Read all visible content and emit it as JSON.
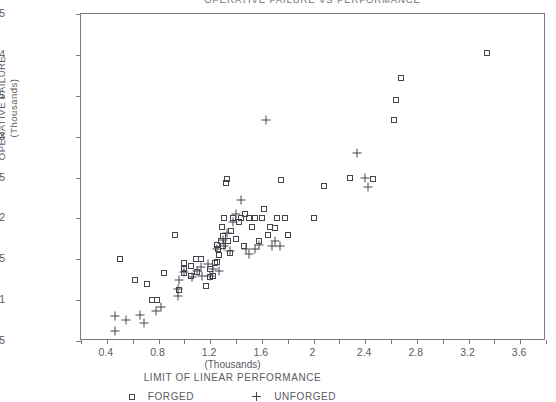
{
  "chart_data": {
    "type": "scatter",
    "title": "OPERATIVE FAILURE VS PERFORMANCE",
    "xlabel": "LIMIT OF LINEAR PERFORMANCE",
    "x_units": "(Thousands)",
    "ylabel": "OPERATIVE FAILURE",
    "y_units": "(Thousands)",
    "xlim": [
      0.2,
      3.8
    ],
    "ylim": [
      0.5,
      4.5
    ],
    "grid": false,
    "legend_position": "bottom",
    "x_ticks": [
      "0.4",
      "0.8",
      "1.2",
      "1.6",
      "2",
      "2.4",
      "2.8",
      "3.2",
      "3.6"
    ],
    "x_tick_values": [
      0.4,
      0.8,
      1.2,
      1.6,
      2.0,
      2.4,
      2.8,
      3.2,
      3.6
    ],
    "y_ticks": [
      "0.5",
      "1",
      "1.5",
      "2",
      "2.5",
      "3",
      "3.5",
      "4",
      "4.5"
    ],
    "y_tick_values": [
      0.5,
      1.0,
      1.5,
      2.0,
      2.5,
      3.0,
      3.5,
      4.0,
      4.5
    ],
    "series": [
      {
        "name": "FORGED",
        "marker": "square",
        "color": "#44444c",
        "points": [
          [
            0.5,
            1.5
          ],
          [
            0.62,
            1.25
          ],
          [
            0.71,
            1.2
          ],
          [
            0.75,
            1.0
          ],
          [
            0.79,
            1.0
          ],
          [
            0.84,
            1.33
          ],
          [
            0.93,
            1.8
          ],
          [
            0.96,
            1.12
          ],
          [
            1.0,
            1.45
          ],
          [
            1.0,
            1.38
          ],
          [
            1.0,
            1.33
          ],
          [
            1.05,
            1.42
          ],
          [
            1.05,
            1.3
          ],
          [
            1.09,
            1.5
          ],
          [
            1.1,
            1.35
          ],
          [
            1.13,
            1.5
          ],
          [
            1.17,
            1.17
          ],
          [
            1.2,
            1.28
          ],
          [
            1.2,
            1.38
          ],
          [
            1.22,
            1.3
          ],
          [
            1.24,
            1.45
          ],
          [
            1.25,
            1.47
          ],
          [
            1.25,
            1.68
          ],
          [
            1.26,
            1.62
          ],
          [
            1.27,
            1.55
          ],
          [
            1.28,
            1.72
          ],
          [
            1.29,
            1.9
          ],
          [
            1.3,
            1.66
          ],
          [
            1.3,
            1.78
          ],
          [
            1.31,
            2.0
          ],
          [
            1.32,
            2.43
          ],
          [
            1.33,
            2.48
          ],
          [
            1.34,
            1.72
          ],
          [
            1.35,
            1.58
          ],
          [
            1.36,
            1.84
          ],
          [
            1.38,
            2.0
          ],
          [
            1.4,
            1.75
          ],
          [
            1.42,
            1.95
          ],
          [
            1.44,
            2.0
          ],
          [
            1.46,
            1.66
          ],
          [
            1.47,
            2.05
          ],
          [
            1.5,
            2.0
          ],
          [
            1.52,
            1.9
          ],
          [
            1.55,
            2.0
          ],
          [
            1.58,
            1.72
          ],
          [
            1.6,
            2.0
          ],
          [
            1.62,
            2.12
          ],
          [
            1.65,
            1.8
          ],
          [
            1.66,
            1.9
          ],
          [
            1.7,
            1.88
          ],
          [
            1.72,
            2.0
          ],
          [
            1.75,
            2.47
          ],
          [
            1.78,
            2.0
          ],
          [
            1.8,
            1.8
          ],
          [
            2.0,
            2.0
          ],
          [
            2.08,
            2.4
          ],
          [
            2.28,
            2.5
          ],
          [
            2.46,
            2.48
          ],
          [
            2.62,
            3.2
          ],
          [
            2.64,
            3.45
          ],
          [
            2.68,
            3.72
          ],
          [
            3.34,
            4.02
          ]
        ]
      },
      {
        "name": "UNFORGED",
        "marker": "plus",
        "color": "#44444c",
        "points": [
          [
            0.46,
            0.8
          ],
          [
            0.46,
            0.62
          ],
          [
            0.55,
            0.76
          ],
          [
            0.66,
            0.82
          ],
          [
            0.69,
            0.72
          ],
          [
            0.78,
            0.87
          ],
          [
            0.82,
            0.91
          ],
          [
            0.95,
            1.05
          ],
          [
            0.95,
            1.14
          ],
          [
            0.96,
            1.25
          ],
          [
            1.0,
            1.35
          ],
          [
            1.06,
            1.28
          ],
          [
            1.1,
            1.36
          ],
          [
            1.13,
            1.4
          ],
          [
            1.14,
            1.3
          ],
          [
            1.18,
            1.44
          ],
          [
            1.2,
            1.3
          ],
          [
            1.22,
            1.38
          ],
          [
            1.25,
            1.62
          ],
          [
            1.27,
            1.36
          ],
          [
            1.3,
            1.74
          ],
          [
            1.31,
            1.66
          ],
          [
            1.33,
            1.82
          ],
          [
            1.35,
            1.6
          ],
          [
            1.38,
            1.96
          ],
          [
            1.4,
            2.05
          ],
          [
            1.44,
            2.22
          ],
          [
            1.48,
            1.62
          ],
          [
            1.5,
            1.56
          ],
          [
            1.55,
            1.62
          ],
          [
            1.58,
            1.68
          ],
          [
            1.63,
            3.2
          ],
          [
            1.68,
            1.66
          ],
          [
            1.7,
            1.72
          ],
          [
            1.74,
            1.66
          ],
          [
            2.34,
            2.8
          ],
          [
            2.4,
            2.5
          ],
          [
            2.42,
            2.38
          ]
        ]
      }
    ]
  }
}
